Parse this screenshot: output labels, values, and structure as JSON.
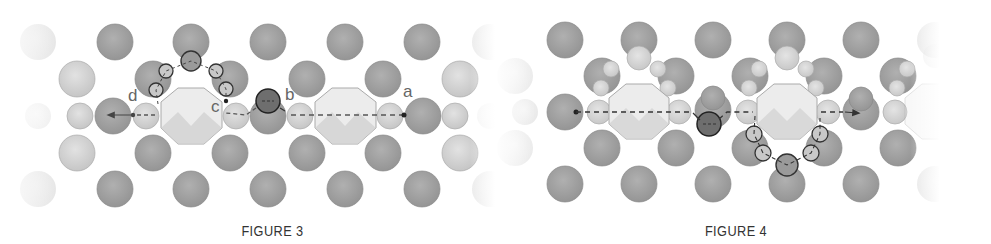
{
  "figures": [
    {
      "id": "figure-3",
      "caption": "FIGURE 3",
      "point_labels": [
        "a",
        "b",
        "c",
        "d"
      ],
      "path_direction": "right-to-left (a → b → c → d)",
      "highlighted_atom": "dark atom between b and c",
      "loop_path": "arc over upper side of left octagon from c to d"
    },
    {
      "id": "figure-4",
      "caption": "FIGURE 4",
      "point_labels": [],
      "path_direction": "left-to-right",
      "highlighted_atom": "dark atom between the two octagons",
      "loop_path": "arc under lower side of right octagon"
    }
  ],
  "colors": {
    "background": "#ffffff",
    "large_atom": "#9a9a9a",
    "small_atom": "#d2d2d2",
    "octagon": "#e6e6e6",
    "highlight_atom": "#6e6e6e",
    "path_line": "#444444",
    "label_text": "#666666",
    "caption_text": "#333333"
  }
}
